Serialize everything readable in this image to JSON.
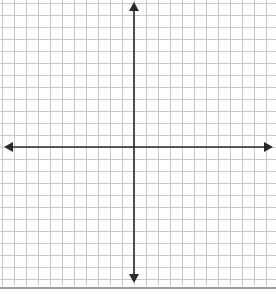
{
  "diagram": {
    "type": "coordinate-plane",
    "grid": {
      "spacing_px": 12,
      "line_color": "#c8c8c8",
      "columns_left_of_y_axis": 11,
      "columns_right_of_y_axis": 12,
      "rows_above_x_axis": 12,
      "rows_below_x_axis": 11
    },
    "axes": {
      "color": "#2a2a2a",
      "x_axis": {
        "y_px": 147,
        "x_start_px": 4,
        "x_end_px": 273,
        "arrows": "both"
      },
      "y_axis": {
        "x_px": 134,
        "y_start_px": 2,
        "y_end_px": 283,
        "arrows": "both"
      }
    },
    "bottom_border": {
      "y_px": 288,
      "color": "#9a9a9a"
    },
    "labels": []
  }
}
